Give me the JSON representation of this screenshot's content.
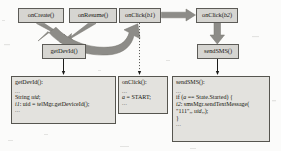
{
  "diagram": {
    "type": "control-flow-callback-diagram",
    "nodes": [
      {
        "id": "onCreate",
        "label": "onCreate()",
        "arg": "",
        "x": 18,
        "y": 8,
        "w": 46,
        "h": 14
      },
      {
        "id": "onResume",
        "label": "onResume()",
        "arg": "",
        "x": 69,
        "y": 8,
        "w": 48,
        "h": 14
      },
      {
        "id": "onClickB1",
        "label": "onClick(",
        "arg": "b1",
        "x": 119,
        "y": 8,
        "w": 42,
        "h": 14
      },
      {
        "id": "onClickB2",
        "label": "onClick(",
        "arg": "b2",
        "x": 196,
        "y": 8,
        "w": 42,
        "h": 14
      },
      {
        "id": "getDevId",
        "label": "getDevId()",
        "arg": "",
        "x": 42,
        "y": 44,
        "w": 44,
        "h": 14
      },
      {
        "id": "sendSMS",
        "label": "sendSMS()",
        "arg": "",
        "x": 197,
        "y": 44,
        "w": 42,
        "h": 14
      }
    ],
    "code_boxes": [
      {
        "id": "getDevId-code",
        "header": "getDevId():",
        "lines": [
          {
            "kind": "dots",
            "text": "..."
          },
          {
            "kind": "code",
            "text": "String ",
            "ital": "uid",
            "tail": ";"
          },
          {
            "kind": "code",
            "text": "",
            "ital": "i1",
            "tail": ": uid = telMgr.getDeviceId();"
          },
          {
            "kind": "dots",
            "text": "..."
          }
        ],
        "x": 11,
        "y": 76,
        "w": 105,
        "h": 48
      },
      {
        "id": "onClick-code",
        "header": "onClick():",
        "lines": [
          {
            "kind": "dots",
            "text": "..."
          },
          {
            "kind": "code",
            "text": "",
            "ital": "a",
            "tail": " = START;"
          },
          {
            "kind": "dots",
            "text": "..."
          }
        ],
        "x": 118,
        "y": 76,
        "w": 50,
        "h": 38
      },
      {
        "id": "sendSMS-code",
        "header": "sendSMS():",
        "lines": [
          {
            "kind": "dots",
            "text": "..."
          },
          {
            "kind": "code",
            "text": "if (",
            "ital": "a",
            "tail": " == State.Started) {"
          },
          {
            "kind": "code",
            "text": "",
            "ital": "i2",
            "tail": ": smsMgr.sendTextMessage("
          },
          {
            "kind": "code",
            "text": "\"111\",, ",
            "ital": "uid",
            "tail": ",,);"
          },
          {
            "kind": "code",
            "text": "}",
            "ital": "",
            "tail": ""
          },
          {
            "kind": "dots",
            "text": "..."
          }
        ],
        "x": 172,
        "y": 76,
        "w": 98,
        "h": 66
      }
    ],
    "code_text_flat": {
      "getDevId": "getDevId(): ... String uid; i1: uid = telMgr.getDeviceId(); ...",
      "onClick": "onClick(): ... a = START; ...",
      "sendSMS": "sendSMS(): ... if (a == State.Started) { i2: smsMgr.sendTextMessage( \"111\",, uid,,); } ..."
    },
    "edges": [
      {
        "id": "onCreate-to-getDevId",
        "from": "onCreate",
        "to": "getDevId",
        "style": "thick-solid"
      },
      {
        "id": "onResume-to-getDevId",
        "from": "onResume",
        "to": "getDevId",
        "style": "thick-solid"
      },
      {
        "id": "getDevId-to-onClickB1",
        "from": "getDevId",
        "to": "onClickB1",
        "style": "thick-curved"
      },
      {
        "id": "onClickB1-to-onClickB2",
        "from": "onClickB1",
        "to": "onClickB2",
        "style": "thick-solid"
      },
      {
        "id": "onClickB2-to-sendSMS",
        "from": "onClickB2",
        "to": "sendSMS",
        "style": "thick-solid"
      },
      {
        "id": "getDevId-to-code",
        "from": "getDevId",
        "to": "getDevId-code",
        "style": "thin-solid"
      },
      {
        "id": "onClickB1-to-code",
        "from": "onClickB1",
        "to": "onClick-code",
        "style": "thin-dotted"
      },
      {
        "id": "sendSMS-to-code",
        "from": "sendSMS",
        "to": "sendSMS-code",
        "style": "thin-solid"
      }
    ],
    "colors": {
      "page_background": "#fbfbfa",
      "node_fill": "#d6d5d1",
      "node_border": "#5c5b57",
      "code_fill": "#e3e2de",
      "code_border": "#56554f",
      "thick_arrow": "#8d8c88",
      "thick_arrow_dark": "#6f6e6a",
      "thin_arrow": "#1c1c1a",
      "text": "#17170f"
    }
  }
}
